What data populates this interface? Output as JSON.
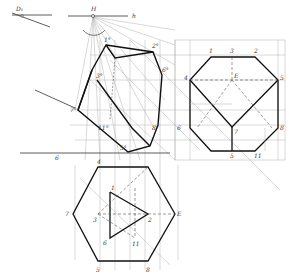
{
  "diagram": {
    "type": "descriptive-geometry perspective construction",
    "labels": {
      "D1": "D₁",
      "H": "H",
      "h": "h",
      "b": "6",
      "top_view": [
        "1",
        "3",
        "2",
        "4",
        "E",
        "5",
        "6",
        "7",
        "8",
        "5",
        "11"
      ],
      "front_view": [
        "4",
        "1",
        "7",
        "3",
        "E",
        "2",
        "6",
        "11",
        "5",
        "8"
      ],
      "perspective": [
        "1°",
        "7°",
        "3°",
        "2°",
        "5°",
        "6°",
        "8°",
        "11°"
      ]
    },
    "colors": {
      "line": "#222222",
      "construction": "#9a9a9a",
      "background": "#ffffff"
    }
  }
}
